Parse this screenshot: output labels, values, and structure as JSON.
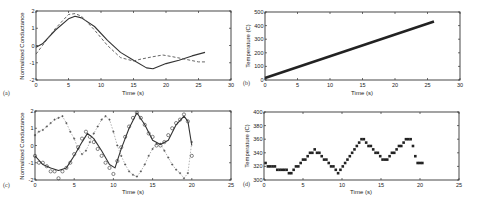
{
  "chart_data": [
    {
      "panel": "(a)",
      "type": "line",
      "xlabel": "Time (s)",
      "ylabel": "Normalized Conductance",
      "xlim": [
        0,
        30
      ],
      "ylim": [
        -2,
        2
      ],
      "xticks": [
        0,
        5,
        10,
        15,
        20,
        25,
        30
      ],
      "yticks": [
        -2,
        -1,
        0,
        1,
        2
      ],
      "grid": false,
      "series": [
        {
          "name": "measured",
          "style": "solid",
          "x": [
            0,
            1,
            3,
            5,
            6,
            7,
            9,
            11,
            13,
            15,
            17,
            18,
            20,
            22,
            24,
            26
          ],
          "y": [
            -0.1,
            0.1,
            0.9,
            1.55,
            1.7,
            1.6,
            1.1,
            0.3,
            -0.4,
            -0.85,
            -1.3,
            -1.35,
            -1.05,
            -0.85,
            -0.6,
            -0.4
          ]
        },
        {
          "name": "model",
          "style": "dashed",
          "x": [
            0,
            1,
            3,
            5,
            6,
            7,
            9,
            11,
            13,
            15,
            16,
            18,
            19.5,
            21,
            23,
            25,
            26
          ],
          "y": [
            -0.5,
            0,
            1.0,
            1.8,
            1.85,
            1.7,
            0.9,
            0,
            -0.7,
            -0.9,
            -0.8,
            -0.65,
            -0.55,
            -0.65,
            -0.8,
            -0.95,
            -0.95
          ]
        }
      ]
    },
    {
      "panel": "(b)",
      "type": "line",
      "xlabel": "Time (s)",
      "ylabel": "Temperature (C)",
      "xlim": [
        0,
        30
      ],
      "ylim": [
        0,
        500
      ],
      "xticks": [
        0,
        5,
        10,
        15,
        20,
        25,
        30
      ],
      "yticks": [
        0,
        100,
        200,
        300,
        400,
        500
      ],
      "grid": false,
      "series": [
        {
          "name": "temperature",
          "style": "thick-markers",
          "x": [
            0,
            26
          ],
          "y": [
            15,
            430
          ]
        }
      ]
    },
    {
      "panel": "(c)",
      "type": "scatter",
      "xlabel": "Time (s)",
      "ylabel": "Normalized Conductance",
      "xlim": [
        0,
        25
      ],
      "ylim": [
        -2,
        2
      ],
      "xticks": [
        0,
        5,
        10,
        15,
        20,
        25
      ],
      "yticks": [
        -2,
        -1,
        0,
        1,
        2
      ],
      "grid": false,
      "series": [
        {
          "name": "fit",
          "style": "solid",
          "x": [
            0,
            1,
            2,
            3,
            4,
            5,
            6,
            6.7,
            7.5,
            8.5,
            9.5,
            10.2,
            11,
            12,
            13,
            14,
            15,
            16,
            17,
            18,
            19,
            19.5,
            20
          ],
          "y": [
            -0.6,
            -1.1,
            -1.3,
            -1.45,
            -1.3,
            -0.6,
            0.2,
            0.7,
            0.4,
            -0.3,
            -1.1,
            -1.3,
            -0.2,
            1.0,
            1.9,
            1.2,
            0.3,
            0.05,
            0.3,
            1.2,
            1.7,
            1.4,
            0
          ]
        },
        {
          "name": "circles",
          "style": "open-circle",
          "x": [
            0,
            0.5,
            1,
            1.5,
            2,
            2.5,
            3,
            3.5,
            4,
            4.5,
            5,
            5.5,
            6,
            6.5,
            7,
            7.5,
            8,
            8.5,
            9,
            9.5,
            10,
            10.5,
            11,
            11.5,
            12,
            12.5,
            13,
            13.5,
            14,
            14.5,
            15,
            15.5,
            16,
            16.5,
            17,
            17.5,
            18,
            18.5,
            19,
            19.5,
            20
          ],
          "y": [
            -0.6,
            -1.0,
            -1.0,
            -1.2,
            -1.5,
            -1.5,
            -1.9,
            -1.5,
            -1.3,
            -1.0,
            -0.5,
            -0.1,
            0.4,
            0.8,
            0.5,
            0.2,
            -0.2,
            -0.6,
            -1.0,
            -1.3,
            -1.65,
            -0.9,
            -0.1,
            0.5,
            1.1,
            1.6,
            1.9,
            1.6,
            1.2,
            0.7,
            0.5,
            0.0,
            0.0,
            0.2,
            0.6,
            1.0,
            1.3,
            1.5,
            1.8,
            1.4,
            -0.6
          ]
        },
        {
          "name": "crosses",
          "style": "dashed-plus",
          "x": [
            0,
            0.5,
            1,
            1.5,
            2,
            2.5,
            3,
            3.5,
            4,
            4.5,
            5,
            5.5,
            6,
            6.5,
            7,
            7.5,
            8,
            8.5,
            9,
            9.5,
            10,
            10.5,
            11,
            11.5,
            12,
            12.5,
            13,
            13.5,
            14,
            14.5,
            15,
            15.5,
            16,
            16.5,
            17,
            17.5,
            18,
            18.5,
            19,
            19.5,
            20
          ],
          "y": [
            0.6,
            0.8,
            0.9,
            1.1,
            1.3,
            1.5,
            1.6,
            1.7,
            1.3,
            0.8,
            0.4,
            -0.2,
            -0.5,
            -0.3,
            0.2,
            0.7,
            1.1,
            1.5,
            1.7,
            1.5,
            0.8,
            0.0,
            -0.6,
            -1.1,
            -1.5,
            -1.7,
            -1.8,
            -1.5,
            -1.1,
            -0.6,
            -0.2,
            0.1,
            0.1,
            -0.3,
            -0.7,
            -1.1,
            -1.4,
            -1.6,
            -1.9,
            -1.6,
            0.2
          ]
        }
      ]
    },
    {
      "panel": "(d)",
      "type": "scatter",
      "xlabel": "Time (s)",
      "ylabel": "Temperature (C)",
      "xlim": [
        0,
        25
      ],
      "ylim": [
        300,
        400
      ],
      "xticks": [
        0,
        5,
        10,
        15,
        20,
        25
      ],
      "yticks": [
        300,
        320,
        340,
        360,
        380,
        400
      ],
      "grid": false,
      "series": [
        {
          "name": "temperature",
          "style": "filled-square",
          "x": [
            0.2,
            0.5,
            0.8,
            1.1,
            1.4,
            1.7,
            2.0,
            2.3,
            2.6,
            2.9,
            3.2,
            3.5,
            3.8,
            4.1,
            4.4,
            4.7,
            5.0,
            5.3,
            5.6,
            5.9,
            6.2,
            6.5,
            6.8,
            7.1,
            7.4,
            7.7,
            8.0,
            8.3,
            8.6,
            8.9,
            9.2,
            9.5,
            9.8,
            10.1,
            10.4,
            10.7,
            11.0,
            11.3,
            11.6,
            11.9,
            12.2,
            12.5,
            12.8,
            13.1,
            13.4,
            13.7,
            14.0,
            14.3,
            14.6,
            14.9,
            15.2,
            15.5,
            15.8,
            16.1,
            16.4,
            16.7,
            17.0,
            17.3,
            17.6,
            17.9,
            18.2,
            18.5,
            18.8,
            19.1,
            19.4,
            19.7,
            20.0,
            20.3
          ],
          "y": [
            325,
            320,
            320,
            320,
            320,
            315,
            315,
            315,
            315,
            315,
            310,
            310,
            315,
            320,
            320,
            325,
            330,
            330,
            335,
            340,
            340,
            345,
            340,
            340,
            335,
            330,
            330,
            325,
            320,
            320,
            315,
            310,
            315,
            320,
            325,
            330,
            335,
            340,
            345,
            350,
            355,
            360,
            360,
            355,
            350,
            350,
            345,
            340,
            340,
            335,
            330,
            330,
            330,
            335,
            340,
            340,
            345,
            350,
            350,
            355,
            360,
            360,
            360,
            350,
            335,
            325,
            325,
            325
          ]
        }
      ]
    }
  ],
  "panels": {
    "a": {
      "label": "(a)",
      "xlabel": "Time (s)",
      "ylabel": "Normalized Conductance"
    },
    "b": {
      "label": "(b)",
      "xlabel": "Time (s)",
      "ylabel": "Temperature (C)"
    },
    "c": {
      "label": "(c)",
      "xlabel": "Time (s)",
      "ylabel": "Normalized Conductance"
    },
    "d": {
      "label": "(d)",
      "xlabel": "Time (s)",
      "ylabel": "Temperature (C)"
    }
  }
}
